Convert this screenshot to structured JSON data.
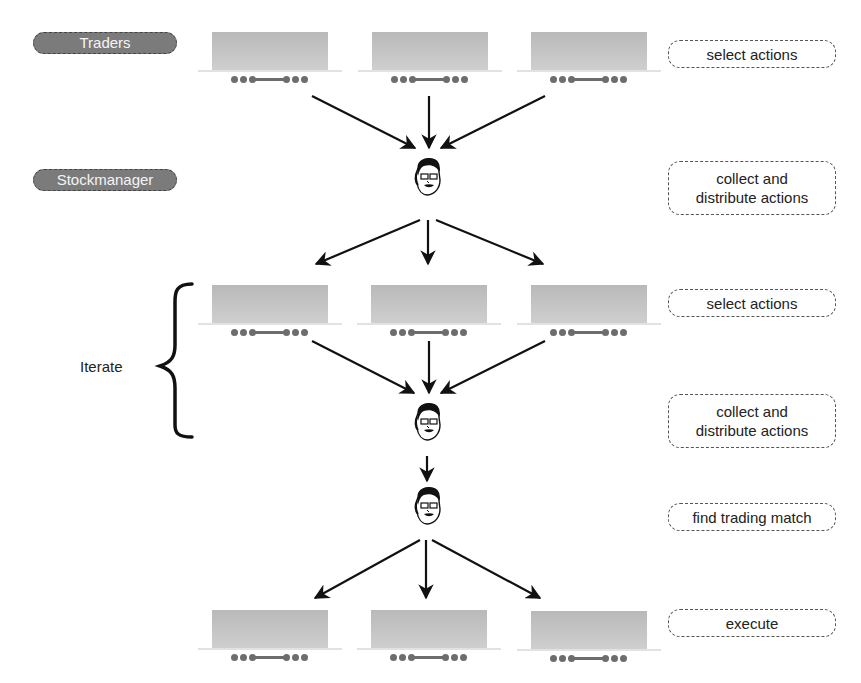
{
  "roles": {
    "traders": "Traders",
    "stockmanager": "Stockmanager"
  },
  "steps": [
    {
      "id": "select-1",
      "label": "select actions"
    },
    {
      "id": "collect-1",
      "label": "collect and distribute actions",
      "lines": [
        "collect and",
        "distribute actions"
      ]
    },
    {
      "id": "select-2",
      "label": "select actions"
    },
    {
      "id": "collect-2",
      "label": "collect and distribute actions",
      "lines": [
        "collect and",
        "distribute actions"
      ]
    },
    {
      "id": "match",
      "label": "find trading match"
    },
    {
      "id": "execute",
      "label": "execute"
    }
  ],
  "loop": {
    "label": "Iterate"
  },
  "nodes": {
    "trader_rows": 3,
    "traders_per_row": 3,
    "manager_faces": 3
  },
  "colors": {
    "role_pill": "#7b7b7b",
    "trader_screen": "#c0c0c0",
    "arrow": "#111111",
    "dashed_border": "#555555"
  }
}
